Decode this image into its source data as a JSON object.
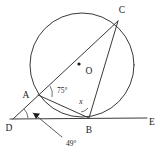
{
  "figure": {
    "type": "circle-geometry-diagram",
    "background_color": "#ffffff",
    "stroke_color": "#3a3a3a",
    "points": {
      "A": {
        "label": "A",
        "x": 38,
        "y": 95
      },
      "B": {
        "label": "B",
        "x": 89,
        "y": 118
      },
      "C": {
        "label": "C",
        "x": 118,
        "y": 20
      },
      "D": {
        "label": "D",
        "x": 14,
        "y": 120
      },
      "E": {
        "label": "E",
        "x": 152,
        "y": 118
      },
      "O": {
        "label": "O",
        "x": 84,
        "y": 66
      }
    },
    "circle": {
      "cx": 82,
      "cy": 65,
      "r": 52
    },
    "angles": {
      "at_A": {
        "label": "75°",
        "value": 75,
        "x": 57,
        "y": 90
      },
      "at_B": {
        "label": "x",
        "value": null,
        "x": 84,
        "y": 102
      },
      "at_D": {
        "label": "49°",
        "value": 49,
        "x": 52,
        "y": 143
      }
    },
    "labels": {
      "A": "A",
      "B": "B",
      "C": "C",
      "D": "D",
      "E": "E",
      "O": "O",
      "angle_a": "75°",
      "angle_b": "x",
      "angle_d": "49°"
    }
  }
}
